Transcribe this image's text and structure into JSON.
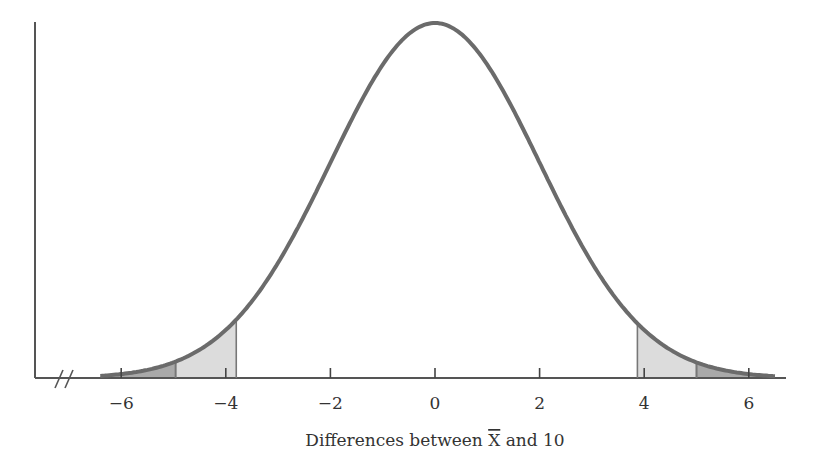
{
  "chart_data": {
    "type": "area",
    "title": "",
    "xlabel": "Differences between X̄ and 10",
    "xlabel_parts": {
      "before": "Differences between ",
      "symbol": "X",
      "after": " and 10"
    },
    "ylabel": "",
    "distribution": {
      "kind": "normal",
      "mean": 0,
      "sd": 2
    },
    "xlim": [
      -6.4,
      6.5
    ],
    "x_ticks": [
      -6,
      -4,
      -2,
      0,
      2,
      4,
      6
    ],
    "x_tick_labels": [
      "−6",
      "−4",
      "−2",
      "0",
      "2",
      "4",
      "6"
    ],
    "axis_break": true,
    "grid": false,
    "shaded_regions": [
      {
        "side": "left",
        "from": -6.4,
        "to": -4.96,
        "shade": "dark",
        "color": "#a9a9a9"
      },
      {
        "side": "left",
        "from": -4.96,
        "to": -3.8,
        "shade": "light",
        "color": "#dcdcdc"
      },
      {
        "side": "right",
        "from": 3.87,
        "to": 5.0,
        "shade": "light",
        "color": "#dcdcdc"
      },
      {
        "side": "right",
        "from": 5.0,
        "to": 6.5,
        "shade": "dark",
        "color": "#a9a9a9"
      }
    ],
    "curve_color": "#6b6b6b",
    "axis_color": "#555555"
  }
}
